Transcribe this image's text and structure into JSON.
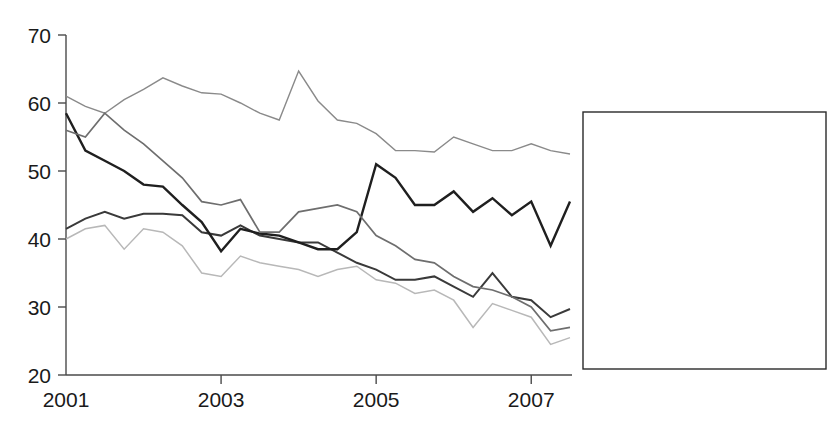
{
  "chart_data": {
    "type": "line",
    "title": "",
    "xlabel": "",
    "ylabel": "",
    "xlim": [
      2001.0,
      2007.5
    ],
    "ylim": [
      20,
      70
    ],
    "ytick_labels": [
      "70",
      "60",
      "50",
      "40",
      "30",
      "20"
    ],
    "ytick_values": [
      70,
      60,
      50,
      40,
      30,
      20
    ],
    "xtick_labels": [
      "2001",
      "2003",
      "2005",
      "2007"
    ],
    "xtick_values": [
      2001,
      2003,
      2005,
      2007
    ],
    "grid": false,
    "legend_position": "right",
    "x": [
      2001.0,
      2001.25,
      2001.5,
      2001.75,
      2002.0,
      2002.25,
      2002.5,
      2002.75,
      2003.0,
      2003.25,
      2003.5,
      2003.75,
      2004.0,
      2004.25,
      2004.5,
      2004.75,
      2005.0,
      2005.25,
      2005.5,
      2005.75,
      2006.0,
      2006.25,
      2006.5,
      2006.75,
      2007.0,
      2007.25,
      2007.5
    ],
    "series": [
      {
        "name": "Food poisoning",
        "color": "#8a8a8a",
        "width": 1.4,
        "values": [
          61.0,
          59.5,
          58.5,
          60.5,
          62.0,
          63.7,
          62.5,
          61.5,
          61.3,
          60.0,
          58.5,
          57.5,
          64.7,
          60.3,
          57.5,
          57.0,
          55.5,
          53.0,
          53.0,
          52.8,
          55.0,
          54.0,
          53.0,
          53.0,
          54.0,
          53.0,
          52.5
        ]
      },
      {
        "name": "Additives",
        "color": "#3a3a3a",
        "width": 2.0,
        "values": [
          41.5,
          43.0,
          44.0,
          43.0,
          43.7,
          43.7,
          43.5,
          41.0,
          40.5,
          42.0,
          40.5,
          40.0,
          39.5,
          39.5,
          38.0,
          36.5,
          35.5,
          34.0,
          34.0,
          34.5,
          33.0,
          31.5,
          35.0,
          31.5,
          31.0,
          28.5,
          29.7
        ]
      },
      {
        "name": "Pesticides",
        "color": "#ffffff",
        "width": 1.4,
        "values": [
          null,
          null,
          null,
          null,
          null,
          null,
          null,
          null,
          null,
          null,
          null,
          null,
          null,
          null,
          null,
          null,
          null,
          null,
          null,
          null,
          null,
          null,
          null,
          null,
          null,
          null,
          null
        ]
      },
      {
        "name": "Feed for livestock",
        "color": "#1f1f1f",
        "width": 2.4,
        "values": [
          58.5,
          53.0,
          51.5,
          50.0,
          48.0,
          47.7,
          45.0,
          42.5,
          38.2,
          41.5,
          40.8,
          40.5,
          39.5,
          38.5,
          38.5,
          41.0,
          51.0,
          49.0,
          45.0,
          45.0,
          47.0,
          44.0,
          46.0,
          43.5,
          45.5,
          39.0,
          45.5
        ]
      },
      {
        "name": "BSE",
        "color": "#6e6e6e",
        "width": 1.7,
        "values": [
          56.0,
          55.0,
          58.5,
          56.0,
          54.0,
          51.5,
          49.0,
          45.5,
          45.0,
          45.8,
          41.0,
          41.0,
          44.0,
          44.5,
          45.0,
          44.0,
          40.5,
          39.0,
          37.0,
          36.5,
          34.5,
          33.0,
          32.5,
          31.5,
          30.0,
          26.5,
          27.0
        ]
      },
      {
        "name": "GM foods",
        "color": "#b8b8b8",
        "width": 1.5,
        "values": [
          40.0,
          41.5,
          42.0,
          38.5,
          41.5,
          41.0,
          39.0,
          35.0,
          34.5,
          37.5,
          36.5,
          36.0,
          35.5,
          34.5,
          35.5,
          36.0,
          34.0,
          33.5,
          32.0,
          32.5,
          31.0,
          27.0,
          30.5,
          29.5,
          28.5,
          24.5,
          25.5
        ]
      }
    ]
  },
  "legend": {
    "entries": [
      {
        "label": "Food poisoning"
      },
      {
        "label": "Additives"
      },
      {
        "label": "Pesticides"
      },
      {
        "label": "Feed for livestock"
      },
      {
        "label": "BSE"
      },
      {
        "label": "GM foods"
      }
    ]
  }
}
